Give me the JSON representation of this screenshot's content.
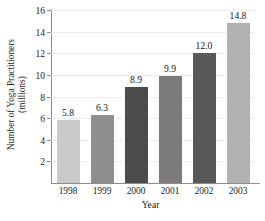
{
  "chart_data": {
    "type": "bar",
    "title": "",
    "subtitle": "",
    "xlabel": "Year",
    "ylabel_line1": "Number of Yoga Practitioners",
    "ylabel_line2": "(millions)",
    "ylabel": "Number of Yoga Practitioners (millions)",
    "categories": [
      "1998",
      "1999",
      "2000",
      "2001",
      "2002",
      "2003"
    ],
    "values": [
      5.8,
      6.3,
      8.9,
      9.9,
      12.0,
      14.8
    ],
    "value_labels": [
      "5.8",
      "6.3",
      "8.9",
      "9.9",
      "12.0",
      "14.8"
    ],
    "bar_colors": [
      "#c9c9c9",
      "#8f8f8f",
      "#4b4b4b",
      "#7b7b7b",
      "#585858",
      "#b1b1b1"
    ],
    "ylim": [
      0,
      16
    ],
    "yticks": [
      2,
      4,
      6,
      8,
      10,
      12,
      14,
      16
    ],
    "ytick_labels": [
      "2",
      "4",
      "6",
      "8",
      "10",
      "12",
      "14",
      "16"
    ],
    "grid": true,
    "legend": "none",
    "axis_color": "#8d8d8d",
    "gridline_color": "#ececec"
  }
}
